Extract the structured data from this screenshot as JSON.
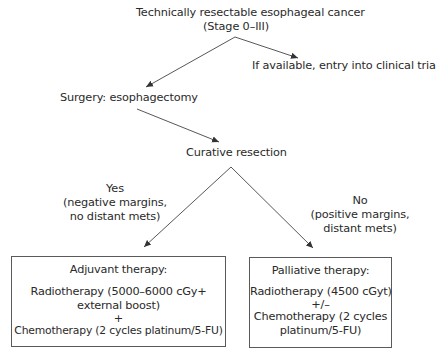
{
  "diagram": {
    "type": "flowchart",
    "root": {
      "line1": "Technically resectable esophageal cancer",
      "line2": "(Stage 0–III)"
    },
    "clinical_trial": "If available, entry into clinical trial",
    "surgery": "Surgery: esophagectomy",
    "curative": "Curative resection",
    "yes_branch": {
      "label": "Yes",
      "detail1": "(negative margins,",
      "detail2": "no distant mets)"
    },
    "no_branch": {
      "label": "No",
      "detail1": "(positive margins,",
      "detail2": "distant mets)"
    },
    "adjuvant_box": {
      "title": "Adjuvant therapy:",
      "line1": "Radiotherapy (5000–6000 cGy+",
      "line2": "external boost)",
      "connector": "+",
      "line3": "Chemotherapy (2 cycles platinum/5-FU)"
    },
    "palliative_box": {
      "title": "Palliative therapy:",
      "line1": "Radiotherapy (4500 cGyt)",
      "connector": "+/–",
      "line2": "Chemotherapy (2 cycles",
      "line3": "platinum/5-FU)"
    },
    "edges": [
      {
        "from": "root",
        "to": "surgery"
      },
      {
        "from": "root",
        "to": "clinical_trial"
      },
      {
        "from": "surgery",
        "to": "curative"
      },
      {
        "from": "curative",
        "to": "adjuvant_box",
        "label": "Yes"
      },
      {
        "from": "curative",
        "to": "palliative_box",
        "label": "No"
      }
    ],
    "colors": {
      "line": "#444444",
      "text": "#2a2a2a",
      "box_border": "#5a5a5a"
    }
  }
}
